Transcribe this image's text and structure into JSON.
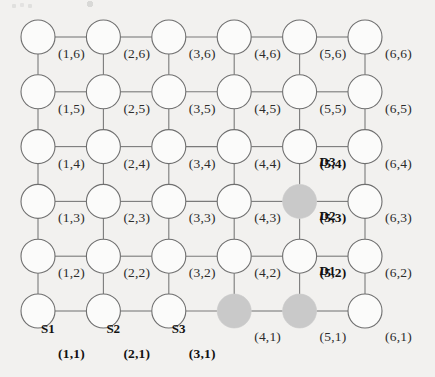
{
  "diagram": {
    "type": "node-link-grid",
    "grid": {
      "columns": 6,
      "rows": 6
    },
    "colors": {
      "background": "#f2f1ef",
      "node_stroke": "#6f6f6f",
      "node_fill": "#fbfbfa",
      "edge": "#7a7a7a",
      "shaded_node_fill": "#c9c9c9",
      "label_text": "#2b2b2b",
      "bold_label_text": "#111111"
    },
    "geometry": {
      "origin_x": 38,
      "origin_y": 311,
      "col_spacing": 65.4,
      "row_spacing": 54.8,
      "node_radius": 17
    },
    "shaded_nodes": [
      "(5,3)",
      "(4,1)",
      "(5,1)"
    ],
    "coord_labels": [
      {
        "text": "(1,6)",
        "col": 1,
        "row": 6,
        "bold": false
      },
      {
        "text": "(2,6)",
        "col": 2,
        "row": 6,
        "bold": false
      },
      {
        "text": "(3,6)",
        "col": 3,
        "row": 6,
        "bold": false
      },
      {
        "text": "(4,6)",
        "col": 4,
        "row": 6,
        "bold": false
      },
      {
        "text": "(5,6)",
        "col": 5,
        "row": 6,
        "bold": false
      },
      {
        "text": "(6,6)",
        "col": 6,
        "row": 6,
        "bold": false
      },
      {
        "text": "(1,5)",
        "col": 1,
        "row": 5,
        "bold": false
      },
      {
        "text": "(2,5)",
        "col": 2,
        "row": 5,
        "bold": false
      },
      {
        "text": "(3,5)",
        "col": 3,
        "row": 5,
        "bold": false
      },
      {
        "text": "(4,5)",
        "col": 4,
        "row": 5,
        "bold": false
      },
      {
        "text": "(5,5)",
        "col": 5,
        "row": 5,
        "bold": false
      },
      {
        "text": "(6,5)",
        "col": 6,
        "row": 5,
        "bold": false
      },
      {
        "text": "(1,4)",
        "col": 1,
        "row": 4,
        "bold": false
      },
      {
        "text": "(2,4)",
        "col": 2,
        "row": 4,
        "bold": false
      },
      {
        "text": "(3,4)",
        "col": 3,
        "row": 4,
        "bold": false
      },
      {
        "text": "(4,4)",
        "col": 4,
        "row": 4,
        "bold": false
      },
      {
        "text": "(5,4)",
        "col": 5,
        "row": 4,
        "bold": true
      },
      {
        "text": "(6,4)",
        "col": 6,
        "row": 4,
        "bold": false
      },
      {
        "text": "(1,3)",
        "col": 1,
        "row": 3,
        "bold": false
      },
      {
        "text": "(2,3)",
        "col": 2,
        "row": 3,
        "bold": false
      },
      {
        "text": "(3,3)",
        "col": 3,
        "row": 3,
        "bold": false
      },
      {
        "text": "(4,3)",
        "col": 4,
        "row": 3,
        "bold": false
      },
      {
        "text": "(5,3)",
        "col": 5,
        "row": 3,
        "bold": true
      },
      {
        "text": "(6,3)",
        "col": 6,
        "row": 3,
        "bold": false
      },
      {
        "text": "(1,2)",
        "col": 1,
        "row": 2,
        "bold": false
      },
      {
        "text": "(2,2)",
        "col": 2,
        "row": 2,
        "bold": false
      },
      {
        "text": "(3,2)",
        "col": 3,
        "row": 2,
        "bold": false
      },
      {
        "text": "(4,2)",
        "col": 4,
        "row": 2,
        "bold": false
      },
      {
        "text": "(5,2)",
        "col": 5,
        "row": 2,
        "bold": true
      },
      {
        "text": "(6,2)",
        "col": 6,
        "row": 2,
        "bold": false
      },
      {
        "text": "(1,1)",
        "col": 1,
        "row": 1,
        "bold": true
      },
      {
        "text": "(2,1)",
        "col": 2,
        "row": 1,
        "bold": true
      },
      {
        "text": "(3,1)",
        "col": 3,
        "row": 1,
        "bold": true
      },
      {
        "text": "(4,1)",
        "col": 4,
        "row": 1,
        "bold": false
      },
      {
        "text": "(5,1)",
        "col": 5,
        "row": 1,
        "bold": false
      },
      {
        "text": "(6,1)",
        "col": 6,
        "row": 1,
        "bold": false
      }
    ],
    "node_names": [
      {
        "text": "S1",
        "col": 1,
        "row": 1,
        "role": "source"
      },
      {
        "text": "S2",
        "col": 2,
        "row": 1,
        "role": "source"
      },
      {
        "text": "S3",
        "col": 3,
        "row": 1,
        "role": "source"
      },
      {
        "text": "D1",
        "col": 5,
        "row": 2,
        "role": "destination"
      },
      {
        "text": "D2",
        "col": 5,
        "row": 3,
        "role": "destination"
      },
      {
        "text": "D3",
        "col": 5,
        "row": 4,
        "role": "destination"
      }
    ]
  }
}
